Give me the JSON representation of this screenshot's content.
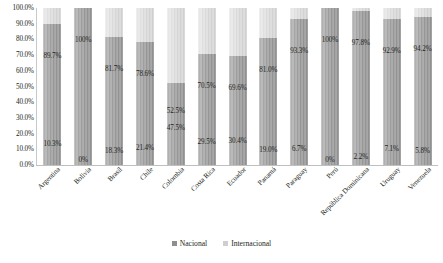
{
  "chart_data": {
    "type": "bar",
    "subtype": "100% stacked column",
    "title": "",
    "subtitle": "",
    "xlabel": "",
    "ylabel": "",
    "ylim": [
      0,
      100
    ],
    "yticks": [
      "0.0%",
      "10.0%",
      "20.0%",
      "30.0%",
      "40.0%",
      "50.0%",
      "60.0%",
      "70.0%",
      "80.0%",
      "90.0%",
      "100.0%"
    ],
    "ytick_values": [
      0,
      10,
      20,
      30,
      40,
      50,
      60,
      70,
      80,
      90,
      100
    ],
    "grid": false,
    "legend_position": "bottom-center",
    "categories": [
      "Argentina",
      "Bolivia",
      "Brasil",
      "Chile",
      "Colombia",
      "Costa Rica",
      "Ecuador",
      "Panamá",
      "Paraguay",
      "Perú",
      "República Dominicana",
      "Uruguay",
      "Venezuela"
    ],
    "series": [
      {
        "name": "Nacional",
        "color": "#8f8f8f",
        "values": [
          89.7,
          100,
          81.7,
          78.6,
          52.5,
          70.5,
          69.6,
          81.0,
          93.3,
          100,
          97.8,
          92.9,
          94.2
        ],
        "labels": [
          "89.7%",
          "100%",
          "81.7%",
          "78.6%",
          "52.5%",
          "70.5%",
          "69.6%",
          "81.0%",
          "93.3%",
          "100%",
          "97.8%",
          "92.9%",
          "94.2%"
        ]
      },
      {
        "name": "Internacional",
        "color": "#cfcfcf",
        "values": [
          10.3,
          0,
          18.3,
          21.4,
          47.5,
          29.5,
          30.4,
          19.0,
          6.7,
          0,
          2.2,
          7.1,
          5.8
        ],
        "labels": [
          "10.3%",
          "0%",
          "18.3%",
          "21.4%",
          "47.5%",
          "29.5%",
          "30.4%",
          "19.0%",
          "6.7%",
          "0%",
          "2.2%",
          "7.1%",
          "5.8%"
        ]
      }
    ]
  },
  "legend": {
    "items": [
      {
        "label": "Nacional",
        "color": "#8f8f8f"
      },
      {
        "label": "Internacional",
        "color": "#cfcfcf"
      }
    ]
  }
}
